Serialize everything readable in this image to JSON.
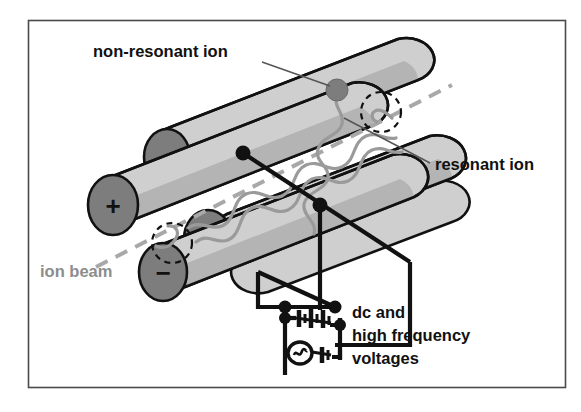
{
  "figure": {
    "title_alt": "Quadrupole mass filter schematic",
    "border_color": "#4a4a4a",
    "background_color": "#ffffff"
  },
  "colors": {
    "rod_body": "#b4b4b4",
    "rod_top_highlight": "#cfcfcf",
    "endcap_fill": "#7d7d7d",
    "trajectory": "#9a9a9a",
    "ion_beam_line": "#a8a8a8",
    "wire": "#111111",
    "text": "#111111",
    "text_gray": "#8d8d8d"
  },
  "labels": {
    "non_resonant_ion": "non-resonant ion",
    "resonant_ion": "resonant ion",
    "ion_beam": "ion beam",
    "dc_and_line1": "dc and",
    "dc_and_line2": "high frequency",
    "dc_and_line3": "voltages"
  },
  "electrode_signs": [
    {
      "name": "front-lower-left-rod-plus",
      "symbol": "+",
      "cx": 113,
      "cy": 205
    },
    {
      "name": "rear-upper-left-rod-minus",
      "symbol": "-",
      "cx": 167,
      "cy": 157
    },
    {
      "name": "front-lower-right-rod-plus",
      "symbol": "+",
      "cx": 208,
      "cy": 239
    },
    {
      "name": "front-bottom-rod-minus",
      "symbol": "-",
      "cx": 163,
      "cy": 272
    }
  ],
  "circuit": {
    "dc_source_name": "dc-battery-symbol",
    "ac_source_name": "ac-generator-symbol",
    "ac_series_cell_name": "ac-series-cell-symbol",
    "junction_count": 6
  },
  "annotations": {
    "non_resonant_ion_marker": "filled gray dot on upper rod",
    "resonant_ion_path": "wavy gray trajectory through rod assembly",
    "ion_beam_axis": "gray dashed line",
    "escape_markers": "two dashed circles showing ejected ion"
  }
}
